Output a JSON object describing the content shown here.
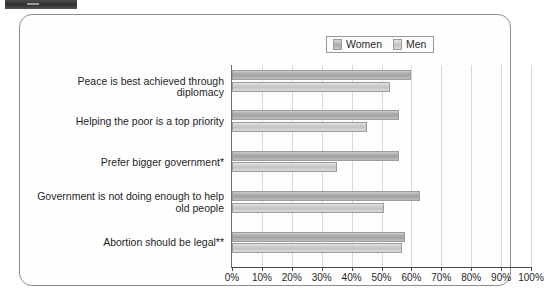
{
  "artifact": {
    "crop_bar_name": "scan-crop-bar"
  },
  "legend": {
    "position": "top-right",
    "entries": [
      {
        "label": "Women",
        "swatch": "women-swatch",
        "color": "#a9a9a9"
      },
      {
        "label": "Men",
        "swatch": "men-swatch",
        "color": "#c9c9c9"
      }
    ]
  },
  "chart_data": {
    "type": "bar",
    "orientation": "horizontal",
    "title": "",
    "subtitle": "",
    "xlabel": "",
    "ylabel": "",
    "xlim": [
      0,
      100
    ],
    "grid": true,
    "legend_position": "top-right",
    "categories": [
      "Peace is best achieved through diplomacy",
      "Helping the poor is a top priority",
      "Prefer bigger government*",
      "Government is not doing enough to help old people",
      "Abortion should be legal**"
    ],
    "category_lines": [
      [
        "Peace is best achieved through diplomacy"
      ],
      [
        "Helping the poor is a top priority"
      ],
      [
        "Prefer bigger government*"
      ],
      [
        "Government is not doing enough to help",
        "old people"
      ],
      [
        "Abortion should be legal**"
      ]
    ],
    "series": [
      {
        "name": "Women",
        "values": [
          60,
          56,
          56,
          63,
          58
        ]
      },
      {
        "name": "Men",
        "values": [
          53,
          45,
          35,
          51,
          57
        ]
      }
    ],
    "tick_values": [
      0,
      10,
      20,
      30,
      40,
      50,
      60,
      70,
      80,
      90,
      100
    ],
    "tick_labels": [
      "0%",
      "10%",
      "20%",
      "30%",
      "40%",
      "50%",
      "60%",
      "70%",
      "80%",
      "90%",
      "100%"
    ]
  }
}
